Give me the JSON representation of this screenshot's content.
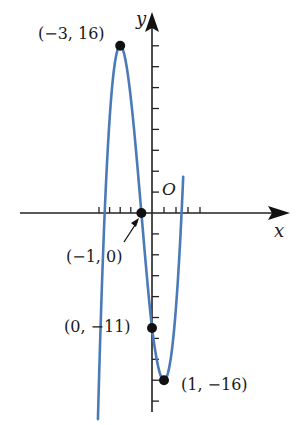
{
  "chart_data": {
    "type": "line",
    "title": "",
    "function": "f(x) = x^3 + 3x^2 - 9x - 11",
    "xlabel": "x",
    "ylabel": "y",
    "origin_label": "O",
    "xlim": [
      -5.1,
      2.6
    ],
    "ylim": [
      -16,
      16
    ],
    "grid": false,
    "x_tick_step": 1,
    "y_tick_step": 2,
    "curve_color": "#4a7ab8",
    "series": [
      {
        "name": "cubic",
        "x": [
          -5.1,
          -4.5,
          -4,
          -3.5,
          -3,
          -2.5,
          -2,
          -1.5,
          -1,
          -0.5,
          0,
          0.5,
          1,
          1.5,
          2,
          2.5,
          2.6
        ],
        "y": [
          -2.4,
          -0.1,
          9,
          14.1,
          16,
          15.1,
          11,
          5.9,
          0,
          -5.6,
          -11,
          -14.9,
          -16,
          -13.2,
          -5,
          4.9,
          3.5
        ]
      }
    ],
    "points": [
      {
        "x": -3,
        "y": 16,
        "label": "(−3, 16)"
      },
      {
        "x": -1,
        "y": 0,
        "label": "(−1, 0)"
      },
      {
        "x": 0,
        "y": -11,
        "label": "(0, −11)"
      },
      {
        "x": 1,
        "y": -16,
        "label": "(1, −16)"
      }
    ],
    "annotations": [
      {
        "text": "(−1, 0)",
        "arrow_to": [
          -1,
          0
        ]
      }
    ]
  }
}
